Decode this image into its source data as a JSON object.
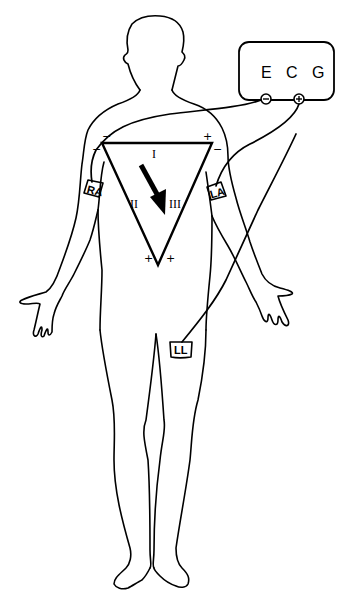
{
  "diagram": {
    "device": {
      "label": "E C G",
      "negative_terminal": "−",
      "positive_terminal": "+"
    },
    "electrodes": [
      {
        "id": "RA",
        "label": "RA"
      },
      {
        "id": "LA",
        "label": "LA"
      },
      {
        "id": "LL",
        "label": "LL"
      }
    ],
    "leads": [
      {
        "id": "I",
        "label": "I"
      },
      {
        "id": "II",
        "label": "II"
      },
      {
        "id": "III",
        "label": "III"
      }
    ],
    "polarity_marks": {
      "top_left_outer": "−",
      "top_left_inner": "−",
      "top_right_inner": "+",
      "top_right_outer": "−",
      "bottom_left": "+",
      "bottom_right": "+"
    },
    "axis_arrow": "mean electrical axis",
    "colors": {
      "line": "#000000",
      "background": "#ffffff"
    }
  }
}
